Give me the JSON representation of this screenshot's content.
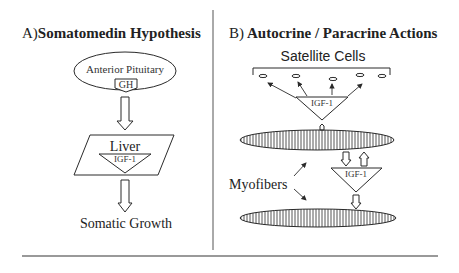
{
  "panel_a": {
    "label": "A)",
    "title": "Somatomedin Hypothesis",
    "nodes": {
      "pituitary": "Anterior Pituitary",
      "gh": "GH",
      "liver": "Liver",
      "igf1": "IGF-1",
      "outcome": "Somatic Growth"
    }
  },
  "panel_b": {
    "label": "B)",
    "title": "Autocrine / Paracrine Actions",
    "nodes": {
      "satellite_cells": "Satellite Cells",
      "igf1_top": "IGF-1",
      "igf1_bottom": "IGF-1",
      "myofibers": "Myofibers"
    }
  },
  "colors": {
    "line": "#2a2a2a",
    "background": "#ffffff",
    "rule": "#777777"
  }
}
